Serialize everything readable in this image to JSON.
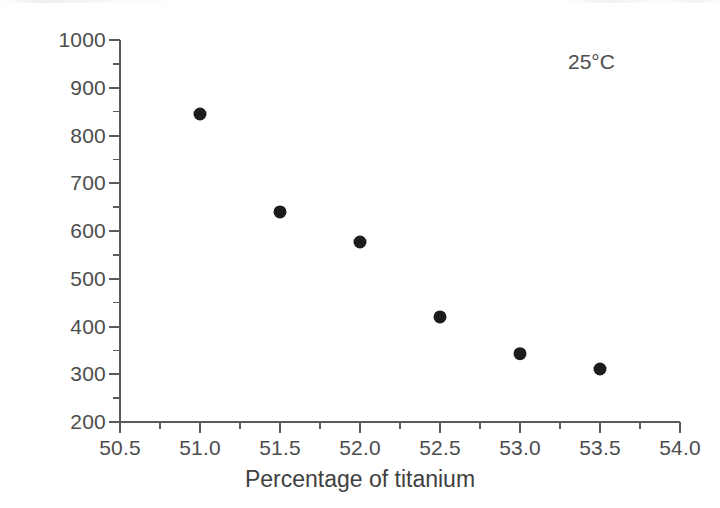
{
  "chart_data": {
    "type": "scatter",
    "title": "",
    "xlabel": "Percentage of titanium",
    "ylabel": "Permittivity",
    "xlim": [
      50.5,
      54.0
    ],
    "ylim": [
      200,
      1000
    ],
    "grid": false,
    "legend": null,
    "x_major_ticks": [
      50.5,
      51.0,
      51.5,
      52.0,
      52.5,
      53.0,
      53.5,
      54.0
    ],
    "x_tick_labels": [
      "50.5",
      "51.0",
      "51.5",
      "52.0",
      "52.5",
      "53.0",
      "53.5",
      "54.0"
    ],
    "x_minor_step": 0.25,
    "y_major_ticks": [
      200,
      300,
      400,
      500,
      600,
      700,
      800,
      900,
      1000
    ],
    "y_tick_labels": [
      "200",
      "300",
      "400",
      "500",
      "600",
      "700",
      "800",
      "900",
      "1000"
    ],
    "y_minor_step": 50,
    "series": [
      {
        "name": "Permittivity at 25°C",
        "marker": "filled-circle",
        "color": "#1c1c1c",
        "marker_size": 13,
        "x": [
          51.0,
          51.5,
          52.0,
          52.5,
          53.0,
          53.5
        ],
        "values": [
          845,
          640,
          577,
          420,
          343,
          311
        ],
        "points": [
          {
            "x": 51.0,
            "y": 845
          },
          {
            "x": 51.5,
            "y": 640
          },
          {
            "x": 52.0,
            "y": 577
          },
          {
            "x": 52.5,
            "y": 420
          },
          {
            "x": 53.0,
            "y": 343
          },
          {
            "x": 53.5,
            "y": 311
          }
        ]
      }
    ],
    "annotations": [
      {
        "text": "25°C",
        "x": 53.6,
        "y": 940,
        "name": "temperature-annotation"
      }
    ],
    "axis_color": "#5a5a5a",
    "spines": {
      "left": true,
      "bottom": true,
      "top": false,
      "right": false
    }
  }
}
